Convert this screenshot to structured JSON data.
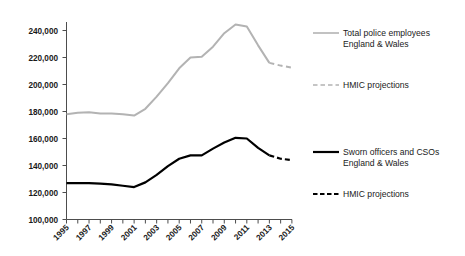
{
  "chart_data": {
    "type": "line",
    "title": "",
    "xlabel": "",
    "ylabel": "",
    "xlim": [
      1995,
      2015
    ],
    "ylim": [
      100000,
      250000
    ],
    "grid": false,
    "legend_position": "right",
    "y_ticks": [
      "100,000",
      "120,000",
      "140,000",
      "160,000",
      "180,000",
      "200,000",
      "220,000",
      "240,000"
    ],
    "y_tick_values": [
      100000,
      120000,
      140000,
      160000,
      180000,
      200000,
      220000,
      240000
    ],
    "x_ticks": [
      "1995",
      "1997",
      "1999",
      "2001",
      "2003",
      "2005",
      "2007",
      "2009",
      "2011",
      "2013",
      "2015"
    ],
    "x_tick_values": [
      1995,
      1997,
      1999,
      2001,
      2003,
      2005,
      2007,
      2009,
      2011,
      2013,
      2015
    ],
    "x_all_years": [
      1995,
      1996,
      1997,
      1998,
      1999,
      2000,
      2001,
      2002,
      2003,
      2004,
      2005,
      2006,
      2007,
      2008,
      2009,
      2010,
      2011,
      2012,
      2013,
      2014,
      2015
    ],
    "series": [
      {
        "name": "Total police employees England & Wales",
        "color": "#b3b3b3",
        "style": "solid",
        "x": [
          1995,
          1996,
          1997,
          1998,
          1999,
          2000,
          2001,
          2002,
          2003,
          2004,
          2005,
          2006,
          2007,
          2008,
          2009,
          2010,
          2011,
          2012,
          2013
        ],
        "values": [
          178000,
          179000,
          179500,
          178500,
          178500,
          178000,
          177000,
          182000,
          191000,
          201000,
          212000,
          220000,
          220500,
          228000,
          238000,
          244500,
          243000,
          229000,
          216000
        ]
      },
      {
        "name": "Total police employees England & Wales HMIC projections",
        "color": "#b3b3b3",
        "style": "dashed",
        "x": [
          2013,
          2014,
          2015
        ],
        "values": [
          216000,
          214000,
          212500
        ]
      },
      {
        "name": "Sworn officers and CSOs England & Wales",
        "color": "#000000",
        "style": "solid",
        "x": [
          1995,
          1996,
          1997,
          1998,
          1999,
          2000,
          2001,
          2002,
          2003,
          2004,
          2005,
          2006,
          2007,
          2008,
          2009,
          2010,
          2011,
          2012,
          2013
        ],
        "values": [
          127000,
          127000,
          127000,
          126500,
          126000,
          125000,
          124000,
          127500,
          133000,
          139500,
          145000,
          147500,
          147500,
          152500,
          157000,
          160500,
          160000,
          153000,
          147500
        ]
      },
      {
        "name": "Sworn officers and CSOs England & Wales HMIC projections",
        "color": "#000000",
        "style": "dashed",
        "x": [
          2013,
          2014,
          2015
        ],
        "values": [
          147500,
          145000,
          144000
        ]
      }
    ]
  },
  "legend": {
    "entries": [
      {
        "label_line1": "Total police employees",
        "label_line2": "England & Wales",
        "color": "#b3b3b3",
        "style": "solid"
      },
      {
        "label_line1": "HMIC projections",
        "label_line2": "",
        "color": "#b3b3b3",
        "style": "dashed"
      },
      {
        "label_line1": "Sworn officers and CSOs",
        "label_line2": "England & Wales",
        "color": "#000000",
        "style": "solid"
      },
      {
        "label_line1": "HMIC  projections",
        "label_line2": "",
        "color": "#000000",
        "style": "dashed"
      }
    ]
  }
}
